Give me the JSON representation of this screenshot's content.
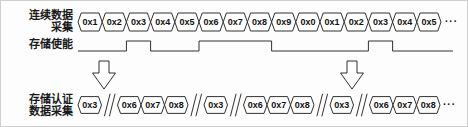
{
  "figure": {
    "background_color": "#fdfdfd",
    "line_color": "#1a1a1a",
    "border_color": "#cfcfcf"
  },
  "rows": {
    "continuous": {
      "label_line1": "连续数据",
      "label_line2": "采集",
      "signal_type": "bus",
      "cells": [
        "0x1",
        "0x2",
        "0x3",
        "0x4",
        "0x5",
        "0x6",
        "0x7",
        "0x8",
        "0x9",
        "0x0",
        "0x1",
        "0x2",
        "0x3",
        "0x4",
        "0x5"
      ],
      "trailing": "···"
    },
    "enable": {
      "label_line1": "存储使能",
      "label_line2": "",
      "signal_type": "digital",
      "pulses": [
        {
          "start_cell_index": 2,
          "end_cell_index": 2,
          "captures": [
            "0x3"
          ]
        },
        {
          "start_cell_index": 5,
          "end_cell_index": 7,
          "captures": [
            "0x6",
            "0x7",
            "0x8"
          ]
        },
        {
          "start_cell_index": 12,
          "end_cell_index": 12,
          "captures": [
            "0x3"
          ]
        }
      ],
      "idle_level": "low",
      "active_level": "high"
    },
    "authenticated": {
      "label_line1": "存储认证",
      "label_line2": "数据采集",
      "signal_type": "bus",
      "groups": [
        {
          "cells": [
            "0x3"
          ]
        },
        {
          "cells": [
            "0x6",
            "0x7",
            "0x8"
          ]
        },
        {
          "cells": [
            "0x3"
          ]
        },
        {
          "cells": [
            "0x6",
            "0x7",
            "0x8"
          ]
        },
        {
          "cells": [
            "0x3"
          ]
        },
        {
          "cells": [
            "0x6",
            "0x7",
            "0x8"
          ]
        }
      ],
      "separator_glyph": "∥",
      "trailing": "···"
    }
  },
  "arrows": [
    {
      "name": "capture-arrow-left",
      "direction": "down"
    },
    {
      "name": "capture-arrow-right",
      "direction": "down"
    }
  ]
}
